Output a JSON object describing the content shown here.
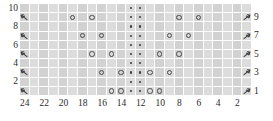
{
  "chart_data": {
    "type": "table",
    "grid": {
      "columns": 24,
      "rows": 10
    },
    "row_labels_right": [
      "9",
      "7",
      "5",
      "3",
      "1"
    ],
    "row_labels_left": [
      "10",
      "8",
      "6",
      "4",
      "2"
    ],
    "column_labels": [
      "24",
      "22",
      "20",
      "18",
      "16",
      "14",
      "12",
      "10",
      "8",
      "6",
      "4",
      "2"
    ],
    "column_label_positions": [
      24,
      22,
      20,
      18,
      16,
      14,
      12,
      10,
      8,
      6,
      4,
      2
    ],
    "legend_symbols": {
      "yo": "yarn-over-circle",
      "purl": "purl-dot",
      "dec_left": "left-leaning-decrease",
      "dec_right": "right-leaning-decrease"
    },
    "colors": {
      "grid_light": "#dcdcdc",
      "grid_dark": "#d2d2d2",
      "grid_line": "#ffffff",
      "symbol": "#4a4a4a",
      "text": "#2b2b2b",
      "background": "#ffffff"
    },
    "rows": [
      {
        "row": 10,
        "label_side": "left",
        "cells": {
          "purl": [
            13,
            12
          ],
          "yo": [],
          "dec_left": [],
          "dec_right": []
        }
      },
      {
        "row": 9,
        "label_side": "right",
        "cells": {
          "purl": [
            13,
            12
          ],
          "yo": [
            19,
            17,
            8,
            6
          ],
          "dec_left": [
            24
          ],
          "dec_right": [
            1
          ]
        }
      },
      {
        "row": 8,
        "label_side": "left",
        "cells": {
          "purl": [
            13,
            12
          ],
          "yo": [],
          "dec_left": [],
          "dec_right": []
        }
      },
      {
        "row": 7,
        "label_side": "right",
        "cells": {
          "purl": [
            13,
            12
          ],
          "yo": [
            18,
            16,
            9,
            7
          ],
          "dec_left": [
            24
          ],
          "dec_right": [
            1
          ]
        }
      },
      {
        "row": 6,
        "label_side": "left",
        "cells": {
          "purl": [
            13,
            12
          ],
          "yo": [],
          "dec_left": [],
          "dec_right": []
        }
      },
      {
        "row": 5,
        "label_side": "right",
        "cells": {
          "purl": [
            13,
            12
          ],
          "yo": [
            17,
            15,
            10,
            8
          ],
          "dec_left": [
            24
          ],
          "dec_right": [
            1
          ]
        }
      },
      {
        "row": 4,
        "label_side": "left",
        "cells": {
          "purl": [
            13,
            12
          ],
          "yo": [],
          "dec_left": [],
          "dec_right": []
        }
      },
      {
        "row": 3,
        "label_side": "right",
        "cells": {
          "purl": [
            13,
            12
          ],
          "yo": [
            16,
            14,
            11,
            9
          ],
          "dec_left": [
            24
          ],
          "dec_right": [
            1
          ]
        }
      },
      {
        "row": 2,
        "label_side": "left",
        "cells": {
          "purl": [
            13,
            12
          ],
          "yo": [],
          "dec_left": [],
          "dec_right": []
        }
      },
      {
        "row": 1,
        "label_side": "right",
        "cells": {
          "purl": [
            13,
            12
          ],
          "yo": [
            15,
            14,
            11,
            10
          ],
          "dec_left": [
            24
          ],
          "dec_right": [
            1
          ]
        }
      }
    ]
  }
}
